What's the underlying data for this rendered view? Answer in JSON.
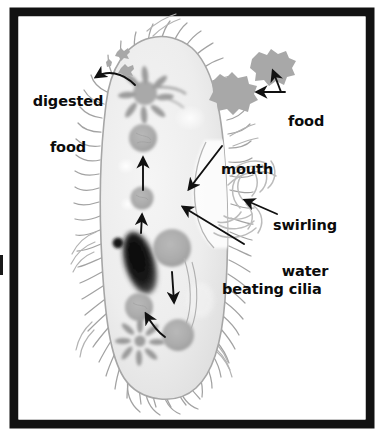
{
  "figure": {
    "kind": "biology-diagram",
    "border_color": "#121212",
    "background_color": "#ffffff",
    "ink_color": "#111111",
    "cell_fill_color": "#e9e9e9",
    "cell_outline_color": "#9a9a9a",
    "food_color": "#a8a8a8",
    "vacuole_color": "#b0b0b0",
    "macronucleus_color": "#111111",
    "water_stroke_color": "#b9b9b9"
  },
  "labels": [
    {
      "id": "digested-food",
      "line1": "digested",
      "line2": "food",
      "x": 40,
      "y": 66,
      "align": "center"
    },
    {
      "id": "food",
      "line1": "food",
      "line2": "",
      "x": 286,
      "y": 90,
      "align": "left"
    },
    {
      "id": "mouth",
      "line1": "mouth",
      "line2": "",
      "x": 219,
      "y": 138,
      "align": "left"
    },
    {
      "id": "swirling-water",
      "line1": "swirling",
      "line2": "water",
      "x": 268,
      "y": 194,
      "align": "left"
    },
    {
      "id": "beating-cilia",
      "line1": "beating cilia",
      "line2": "",
      "x": 222,
      "y": 251,
      "align": "left"
    }
  ],
  "structures": [
    {
      "id": "anal-pore",
      "name": "anal pore star vacuole"
    },
    {
      "id": "contractile-vacuole",
      "name": "contractile vacuole star"
    },
    {
      "id": "macronucleus",
      "name": "macronucleus"
    },
    {
      "id": "micronucleus",
      "name": "micronucleus"
    },
    {
      "id": "oral-groove",
      "name": "oral groove / mouth"
    },
    {
      "id": "food-vacuole",
      "name": "food vacuole"
    },
    {
      "id": "cilia",
      "name": "cilia fringe"
    },
    {
      "id": "food-particle",
      "name": "food particle"
    },
    {
      "id": "digested-food-particle",
      "name": "expelled digested food particle"
    },
    {
      "id": "swirling-water-arcs",
      "name": "swirling water arcs"
    },
    {
      "id": "flow-arrow",
      "name": "cytoplasmic streaming arrow"
    }
  ]
}
